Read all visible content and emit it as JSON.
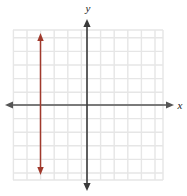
{
  "figure": {
    "width": 187,
    "height": 196,
    "background": "#ffffff"
  },
  "axes": {
    "x_label": "x",
    "y_label": "y",
    "x_axis_color": "#555555",
    "y_axis_color": "#3a3a3a",
    "origin_px": {
      "x": 87,
      "y": 105
    },
    "x_axis_y_px": 105,
    "y_axis_x_px": 87,
    "x_axis_start_px": 5,
    "x_axis_end_px": 174,
    "y_axis_start_px": 19,
    "y_axis_end_px": 191,
    "arrowheads": [
      "left",
      "right",
      "up",
      "down"
    ]
  },
  "grid": {
    "color": "#e6e6e6",
    "left_px": 13,
    "right_px": 163,
    "top_px": 30,
    "bottom_px": 180,
    "cell_px": 13.6,
    "show_grid": true,
    "vertical_lines_px": [
      13.4,
      27.0,
      40.6,
      54.2,
      67.8,
      81.4,
      87.0,
      100.6,
      114.2,
      127.8,
      141.4,
      155.0,
      163.0
    ],
    "horizontal_lines_px": [
      30.0,
      37.8,
      51.4,
      65.0,
      78.6,
      92.2,
      105.0,
      118.6,
      132.2,
      145.8,
      159.4,
      173.0,
      180.0
    ]
  },
  "chart_data": {
    "type": "line",
    "title": "",
    "xlabel": "x",
    "ylabel": "y",
    "xlim": [
      -5.5,
      5.5
    ],
    "ylim": [
      -5.5,
      5.5
    ],
    "grid": true,
    "legend": null,
    "series": [
      {
        "name": "vertical-line",
        "equation": "x = -3.5",
        "color": "#a0392c",
        "x": [
          -3.5,
          -3.5
        ],
        "y": [
          5.3,
          -5.1
        ],
        "arrow_start": true,
        "arrow_end": true,
        "pixel_x": 40.5,
        "pixel_y_top": 33,
        "pixel_y_bottom": 175
      }
    ]
  }
}
